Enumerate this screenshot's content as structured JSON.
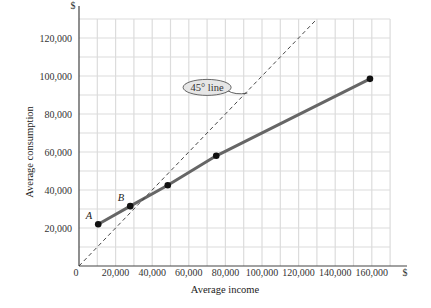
{
  "chart_data": {
    "type": "line",
    "title": "",
    "xlabel": "Average income",
    "ylabel": "Average consumption",
    "x_unit_label": "$",
    "y_unit_label": "$",
    "x_origin_label": "0",
    "xlim": [
      0,
      170000
    ],
    "ylim": [
      0,
      130000
    ],
    "grid": true,
    "grid_step": 10000,
    "x_ticks": [
      20000,
      40000,
      60000,
      80000,
      100000,
      120000,
      140000,
      160000
    ],
    "x_tick_labels": [
      "20,000",
      "40,000",
      "60,000",
      "80,000",
      "100,000",
      "120,000",
      "140,000",
      "160,000"
    ],
    "y_ticks": [
      20000,
      40000,
      60000,
      80000,
      100000,
      120000
    ],
    "y_tick_labels": [
      "20,000",
      "40,000",
      "60,000",
      "80,000",
      "100,000",
      "120,000"
    ],
    "series": [
      {
        "name": "Average consumption",
        "style": "solid",
        "color": "#666666",
        "x": [
          10500,
          28000,
          48500,
          75000,
          159000
        ],
        "y": [
          22000,
          31500,
          42500,
          58000,
          98500
        ],
        "point_labels": [
          "A",
          "B",
          "",
          "",
          ""
        ]
      },
      {
        "name": "45° line",
        "style": "dashed",
        "color": "#333333",
        "x": [
          0,
          130000
        ],
        "y": [
          0,
          130000
        ]
      }
    ],
    "annotations": [
      {
        "text": "45° line",
        "x": 70000,
        "y": 94000,
        "shape": "ellipse",
        "points_to": [
          92000,
          91000
        ]
      }
    ]
  }
}
